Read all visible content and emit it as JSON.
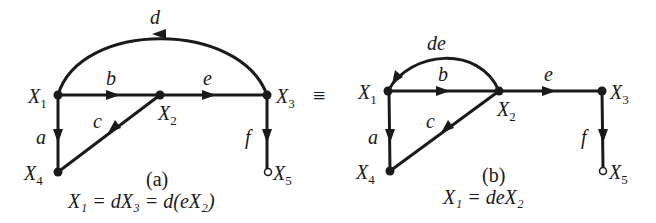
{
  "figure": {
    "equivalence_symbol": "≡",
    "panel_a": {
      "caption": "(a)",
      "equation": "X₁ = dX₃ = d(eX₂)",
      "nodes": [
        {
          "id": "X1",
          "label": "X",
          "sub": "1"
        },
        {
          "id": "X2",
          "label": "X",
          "sub": "2"
        },
        {
          "id": "X3",
          "label": "X",
          "sub": "3"
        },
        {
          "id": "X4",
          "label": "X",
          "sub": "4"
        },
        {
          "id": "X5",
          "label": "X",
          "sub": "5"
        }
      ],
      "edges": [
        {
          "from": "X1",
          "to": "X2",
          "gain": "b"
        },
        {
          "from": "X2",
          "to": "X3",
          "gain": "e"
        },
        {
          "from": "X3",
          "to": "X1",
          "gain": "d"
        },
        {
          "from": "X1",
          "to": "X4",
          "gain": "a"
        },
        {
          "from": "X2",
          "to": "X4",
          "gain": "c"
        },
        {
          "from": "X3",
          "to": "X5",
          "gain": "f"
        }
      ]
    },
    "panel_b": {
      "caption": "(b)",
      "equation": "X₁ = deX₂",
      "nodes": [
        {
          "id": "X1",
          "label": "X",
          "sub": "1"
        },
        {
          "id": "X2",
          "label": "X",
          "sub": "2"
        },
        {
          "id": "X3",
          "label": "X",
          "sub": "3"
        },
        {
          "id": "X4",
          "label": "X",
          "sub": "4"
        },
        {
          "id": "X5",
          "label": "X",
          "sub": "5"
        }
      ],
      "edges": [
        {
          "from": "X1",
          "to": "X2",
          "gain": "b"
        },
        {
          "from": "X2",
          "to": "X3",
          "gain": "e"
        },
        {
          "from": "X2",
          "to": "X1",
          "gain": "de"
        },
        {
          "from": "X1",
          "to": "X4",
          "gain": "a"
        },
        {
          "from": "X2",
          "to": "X4",
          "gain": "c"
        },
        {
          "from": "X3",
          "to": "X5",
          "gain": "f"
        }
      ]
    }
  }
}
